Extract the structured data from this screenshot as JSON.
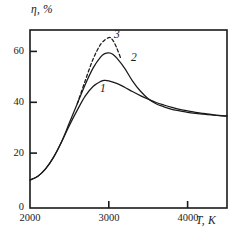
{
  "chart_data": {
    "type": "line",
    "title": "",
    "xlabel": "T, K",
    "ylabel": "η, %",
    "xlim": [
      2000,
      4500
    ],
    "ylim": [
      0,
      70
    ],
    "xticks": [
      2000,
      3000,
      4000
    ],
    "xtick_labels": [
      "2000",
      "3000",
      "4000"
    ],
    "yticks": [
      0,
      20,
      40,
      60
    ],
    "ytick_labels": [
      "0",
      "20",
      "40",
      "60"
    ],
    "grid": false,
    "legend": "inline-curve-labels",
    "series": [
      {
        "name": "1",
        "label": "1",
        "style": "solid",
        "color": "#1a1a1a",
        "x": [
          2000,
          2100,
          2200,
          2300,
          2400,
          2500,
          2600,
          2700,
          2800,
          2900,
          2950,
          3000,
          3100,
          3200,
          3300,
          3400,
          3500,
          3600,
          3700,
          3800,
          3900,
          4000,
          4100,
          4200,
          4300,
          4400,
          4500
        ],
        "y": [
          11,
          12.5,
          15.5,
          20,
          26,
          32.5,
          38.5,
          44,
          47.8,
          49.8,
          50.2,
          50,
          49,
          47.5,
          45.8,
          44.2,
          42.8,
          41.5,
          40.5,
          39.6,
          38.8,
          38.2,
          37.6,
          37.2,
          36.8,
          36.4,
          36.2
        ]
      },
      {
        "name": "2",
        "label": "2",
        "style": "solid",
        "color": "#1a1a1a",
        "x": [
          2000,
          2100,
          2200,
          2300,
          2400,
          2500,
          2600,
          2700,
          2800,
          2900,
          2950,
          3000,
          3050,
          3100,
          3200,
          3300,
          3400,
          3500,
          3600,
          3700,
          3800,
          3900,
          4000,
          4100,
          4200,
          4300,
          4400,
          4500
        ],
        "y": [
          11,
          12.5,
          15.5,
          20,
          26,
          33.5,
          41,
          48.5,
          55,
          59.5,
          60.7,
          61,
          60.5,
          59,
          55,
          50,
          46,
          43,
          41,
          39.8,
          38.8,
          38.2,
          37.6,
          37.2,
          36.9,
          36.6,
          36.3,
          36.1
        ]
      },
      {
        "name": "3",
        "label": "3",
        "style": "dashed",
        "color": "#1a1a1a",
        "x": [
          2600,
          2700,
          2800,
          2900,
          3000,
          3050,
          3100,
          3150
        ],
        "y": [
          41,
          50,
          58.5,
          64.5,
          67,
          66,
          63,
          59
        ]
      }
    ],
    "curve_label_positions": [
      {
        "label": "1",
        "x": 2950,
        "y": 44
      },
      {
        "label": "2",
        "x": 3320,
        "y": 57
      },
      {
        "label": "3",
        "x": 3110,
        "y": 68
      }
    ],
    "colors": {
      "axis": "#1a1a1a",
      "curve": "#1a1a1a",
      "background": "#ffffff"
    }
  }
}
